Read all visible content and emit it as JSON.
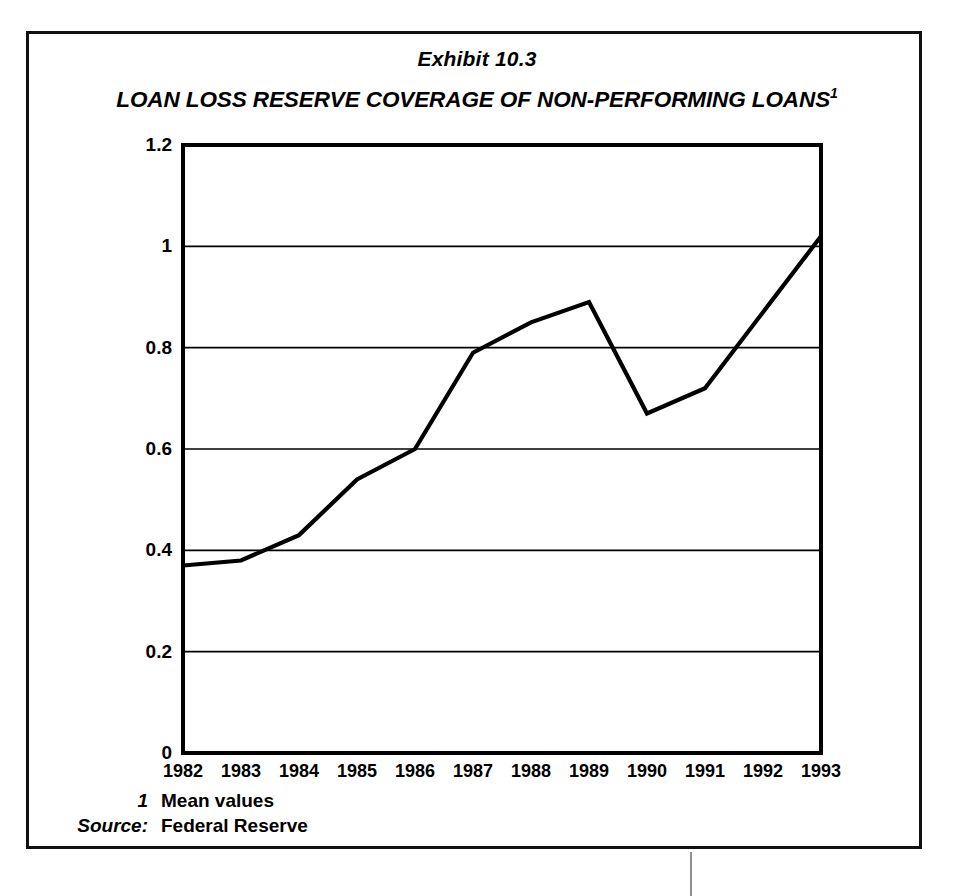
{
  "exhibit_label": "Exhibit 10.3",
  "title": {
    "text": "LOAN LOSS RESERVE COVERAGE OF NON-PERFORMING LOANS",
    "superscript": "1"
  },
  "footnotes": [
    {
      "key": "1",
      "value": "Mean values"
    },
    {
      "key": "Source:",
      "value": "Federal Reserve"
    }
  ],
  "chart_data": {
    "type": "line",
    "title": "LOAN LOSS RESERVE COVERAGE OF NON-PERFORMING LOANS",
    "xlabel": "",
    "ylabel": "",
    "categories": [
      "1982",
      "1983",
      "1984",
      "1985",
      "1986",
      "1987",
      "1988",
      "1989",
      "1990",
      "1991",
      "1992",
      "1993"
    ],
    "x": [
      1982,
      1983,
      1984,
      1985,
      1986,
      1987,
      1988,
      1989,
      1990,
      1991,
      1992,
      1993
    ],
    "values": [
      0.37,
      0.38,
      0.43,
      0.54,
      0.6,
      0.79,
      0.85,
      0.89,
      0.67,
      0.72,
      0.87,
      1.02
    ],
    "ylim": [
      0,
      1.2
    ],
    "yticks": [
      0,
      0.2,
      0.4,
      0.6,
      0.8,
      1,
      1.2
    ],
    "ytick_labels": [
      "0",
      "0.2",
      "0.4",
      "0.6",
      "0.8",
      "1",
      "1.2"
    ],
    "grid": true,
    "grid_axis": "y",
    "legend": false,
    "line_color": "#000000",
    "line_width": 4.2,
    "border_color": "#000000",
    "background": "#ffffff"
  }
}
